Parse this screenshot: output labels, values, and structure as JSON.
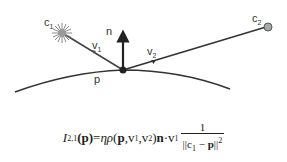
{
  "diagram": {
    "labels": {
      "c1": "c",
      "c1_sub": "1",
      "c2": "c",
      "c2_sub": "2",
      "n": "n",
      "v1": "v",
      "v1_sub": "1",
      "v2": "v",
      "v2_sub": "2",
      "p": "p"
    },
    "colors": {
      "line": "#333333",
      "light_source": "#8a8a8a",
      "point_c2": "#999999",
      "surface_point": "#222222"
    }
  },
  "formula": {
    "lhs_I": "I",
    "lhs_sub": "2,1",
    "lhs_arg": "(p)",
    "equals": " = ",
    "eta": "η",
    "rho": "ρ",
    "args_open": "(",
    "arg_p": "p",
    "comma1": ", ",
    "arg_v1": "v",
    "arg_v1_sub": "1",
    "comma2": ", ",
    "arg_v2": "v",
    "arg_v2_sub": "2",
    "args_close": ")",
    "n": "n",
    "dot": " · ",
    "v": "v",
    "v_sub": "1",
    "numerator": "1",
    "den_open": "||c",
    "den_c_sub": "1",
    "den_mid": " − ",
    "den_p": "p",
    "den_close": "||",
    "den_sup": "2"
  }
}
